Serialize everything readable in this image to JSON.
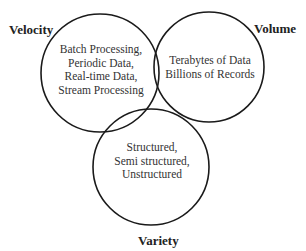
{
  "diagram": {
    "type": "venn",
    "sets": [
      {
        "name": "Velocity",
        "items": [
          "Batch Processing,",
          "Periodic Data,",
          "Real-time Data,",
          "Stream Processing"
        ]
      },
      {
        "name": "Volume",
        "items": [
          "Terabytes of Data",
          "Billions of Records"
        ]
      },
      {
        "name": "Variety",
        "items": [
          "Structured,",
          "Semi structured,",
          "Unstructured"
        ]
      }
    ],
    "stroke_color": "#1a1a1a",
    "background": "#ffffff"
  }
}
